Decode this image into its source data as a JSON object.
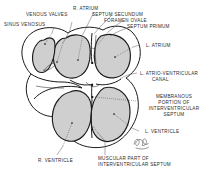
{
  "figure": {
    "background_color": "#ffffff",
    "ink_color": "#1b1b1b",
    "chamber_fill": "#cfcfcf",
    "signature": "artist-monogram"
  },
  "labels": {
    "venous_valves": "VENOUS VALVES",
    "sinus_venosus": "SINUS VENOSUS",
    "r_atrium": "R. ATRIUM",
    "septum_secundum": "SEPTUM SECUNDUM",
    "foramen_ovale": "FORAMEN OVALE",
    "septum_primum": "SEPTUM PRIMUM",
    "l_atrium": "L. ATRIUM",
    "l_atrio_ventricular_canal_line1": "L. ATRIO-VENTRICULAR",
    "l_atrio_ventricular_canal_line2": "CANAL",
    "membranous_line1": "MEMBRANOUS",
    "membranous_line2": "PORTION OF",
    "membranous_line3": "INTERVENTRICULAR",
    "membranous_line4": "SEPTUM",
    "l_ventricle": "L. VENTRICLE",
    "r_ventricle": "R. VENTRICLE",
    "muscular_line1": "MUSCULAR PART OF",
    "muscular_line2": "INTERVENTRICULAR SEPTUM"
  }
}
